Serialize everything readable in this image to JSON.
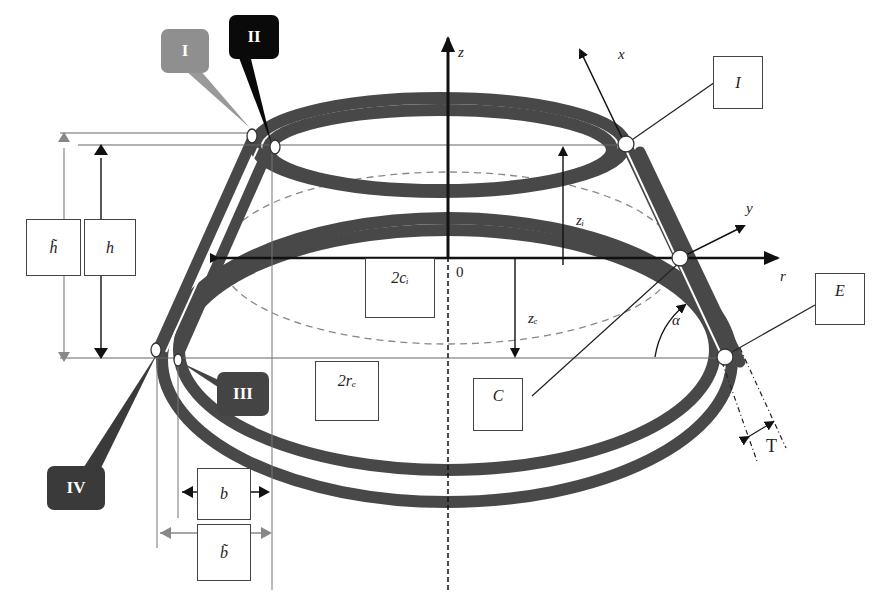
{
  "diagram": {
    "type": "conical ring structure (truncated cone with elliptical rings)",
    "colors": {
      "ring": "#444444",
      "tag_I": "#8f8f8f",
      "tag_II": "#0a0a0a",
      "tag_III": "#444444",
      "tag_IV": "#3a3a3a",
      "dim_gray": "#888888"
    },
    "axes": {
      "z": "z",
      "x": "x",
      "y": "y",
      "r": "r",
      "origin": "0"
    },
    "tags": [
      {
        "id": "I",
        "label": "I"
      },
      {
        "id": "II",
        "label": "II"
      },
      {
        "id": "III",
        "label": "III"
      },
      {
        "id": "IV",
        "label": "IV"
      }
    ],
    "boxes": {
      "I_italic": "I",
      "E": "E",
      "C": "C",
      "h_tilde": "h̃",
      "h": "h",
      "two_ci": "2cᵢ",
      "two_re": "2rₑ",
      "b": "b",
      "b_tilde": "b̃"
    },
    "labels": {
      "zi": "zᵢ",
      "ze": "zₑ",
      "alpha": "α",
      "T": "T"
    }
  }
}
